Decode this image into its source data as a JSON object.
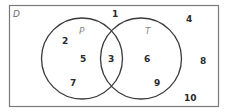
{
  "diagram": {
    "type": "venn",
    "universe": {
      "label": "D"
    },
    "sets": [
      {
        "label": "P"
      },
      {
        "label": "T"
      }
    ],
    "regions": {
      "p_only": [
        "2",
        "5",
        "7"
      ],
      "both": [
        "3"
      ],
      "t_only": [
        "6",
        "9"
      ],
      "outside": [
        "1",
        "4",
        "8",
        "10"
      ]
    },
    "colors": {
      "stroke": "#3a3a3a",
      "border": "#6a6a6a",
      "text": "#2a2a2a"
    }
  }
}
